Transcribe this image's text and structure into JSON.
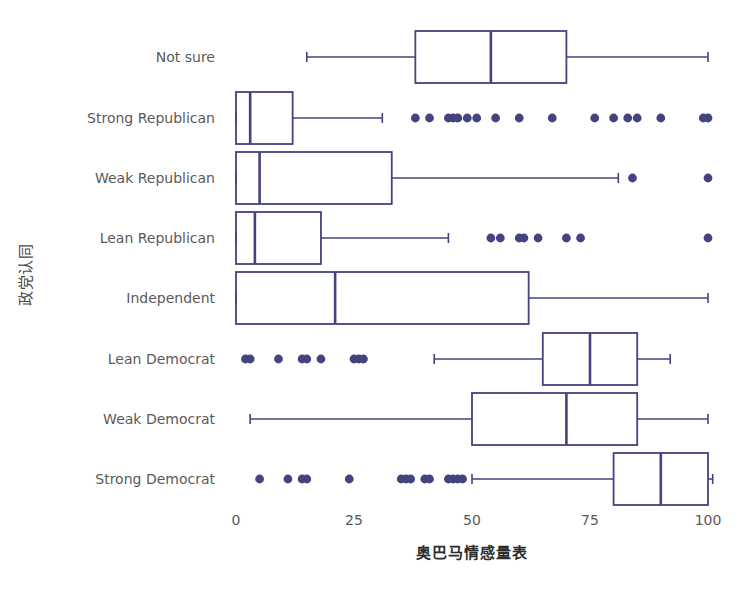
{
  "chart_data": {
    "type": "box",
    "orientation": "horizontal",
    "title": "",
    "xlabel": "奥巴马情感量表",
    "ylabel": "政党认同",
    "xlim": [
      -4,
      104
    ],
    "xticks": [
      0,
      25,
      50,
      75,
      100
    ],
    "xtick_labels": [
      "0",
      "25",
      "50",
      "75",
      "100"
    ],
    "grid": false,
    "legend": "none",
    "accent_color": "#43437f",
    "text_color": "#5a5a5a",
    "background": "#ffffff",
    "categories": [
      "Not sure",
      "Strong Republican",
      "Weak Republican",
      "Lean Republican",
      "Independent",
      "Lean Democrat",
      "Weak Democrat",
      "Strong Democrat"
    ],
    "boxes": [
      {
        "category": "Not sure",
        "whisker_low": 15,
        "q1": 38,
        "median": 54,
        "q3": 70,
        "whisker_high": 100,
        "outliers": []
      },
      {
        "category": "Strong Republican",
        "whisker_low": 0,
        "q1": 0,
        "median": 3,
        "q3": 12,
        "whisker_high": 31,
        "outliers": [
          38,
          41,
          45,
          46,
          47,
          49,
          51,
          55,
          60,
          67,
          76,
          80,
          83,
          85,
          90,
          99,
          100
        ]
      },
      {
        "category": "Weak Republican",
        "whisker_low": 0,
        "q1": 0,
        "median": 5,
        "q3": 33,
        "whisker_high": 81,
        "outliers": [
          84,
          100
        ]
      },
      {
        "category": "Lean Republican",
        "whisker_low": 0,
        "q1": 0,
        "median": 4,
        "q3": 18,
        "whisker_high": 45,
        "outliers": [
          54,
          56,
          60,
          61,
          64,
          70,
          73,
          100
        ]
      },
      {
        "category": "Independent",
        "whisker_low": 0,
        "q1": 0,
        "median": 21,
        "q3": 62,
        "whisker_high": 100,
        "outliers": []
      },
      {
        "category": "Lean Democrat",
        "whisker_low": 42,
        "q1": 65,
        "median": 75,
        "q3": 85,
        "whisker_high": 92,
        "outliers": [
          2,
          3,
          9,
          14,
          15,
          18,
          25,
          26,
          27
        ]
      },
      {
        "category": "Weak Democrat",
        "whisker_low": 3,
        "q1": 50,
        "median": 70,
        "q3": 85,
        "whisker_high": 100,
        "outliers": []
      },
      {
        "category": "Strong Democrat",
        "whisker_low": 50,
        "q1": 80,
        "median": 90,
        "q3": 100,
        "whisker_high": 101,
        "outliers": [
          5,
          11,
          14,
          15,
          24,
          35,
          36,
          37,
          40,
          41,
          45,
          46,
          47,
          48
        ]
      }
    ]
  }
}
